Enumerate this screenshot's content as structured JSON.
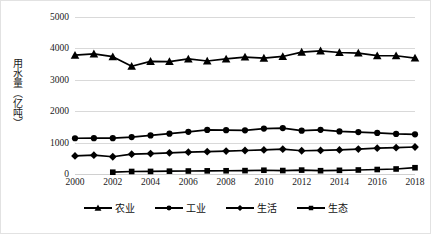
{
  "chart_data": {
    "type": "line",
    "title": "",
    "xlabel": "",
    "ylabel": "用水量（亿吨）",
    "ylim": [
      0,
      5000
    ],
    "ytick_values": [
      0,
      1000,
      2000,
      3000,
      4000,
      5000
    ],
    "ytick_labels": [
      "0",
      "1000",
      "2000",
      "3000",
      "4000",
      "5000"
    ],
    "xlim": [
      2000,
      2018
    ],
    "x": [
      2000,
      2001,
      2002,
      2003,
      2004,
      2005,
      2006,
      2007,
      2008,
      2009,
      2010,
      2011,
      2012,
      2013,
      2014,
      2015,
      2016,
      2017,
      2018
    ],
    "xtick_values": [
      2000,
      2002,
      2004,
      2006,
      2008,
      2010,
      2012,
      2014,
      2016,
      2018
    ],
    "xtick_labels": [
      "2000",
      "2002",
      "2004",
      "2006",
      "2008",
      "2010",
      "2012",
      "2014",
      "2016",
      "2018"
    ],
    "grid": true,
    "grid_axis": "y",
    "legend_position": "bottom",
    "line_color": "#000000",
    "grid_color": "#d9d9d9",
    "series": [
      {
        "name": "农业",
        "marker": "triangle",
        "values": [
          3784,
          3826,
          3736,
          3433,
          3586,
          3580,
          3664,
          3599,
          3664,
          3723,
          3689,
          3743,
          3880,
          3922,
          3869,
          3852,
          3768,
          3766,
          3693
        ]
      },
      {
        "name": "工业",
        "marker": "circle",
        "values": [
          1139,
          1142,
          1142,
          1177,
          1229,
          1285,
          1344,
          1404,
          1397,
          1391,
          1447,
          1462,
          1381,
          1406,
          1356,
          1335,
          1308,
          1277,
          1262
        ]
      },
      {
        "name": "生活",
        "marker": "diamond",
        "values": [
          575,
          600,
          549,
          631,
          651,
          675,
          694,
          710,
          729,
          748,
          766,
          790,
          740,
          750,
          767,
          794,
          822,
          838,
          860
        ]
      },
      {
        "name": "生态",
        "marker": "square",
        "values": [
          null,
          null,
          57,
          80,
          82,
          90,
          95,
          100,
          103,
          108,
          120,
          110,
          124,
          105,
          117,
          128,
          143,
          160,
          200
        ]
      }
    ]
  }
}
